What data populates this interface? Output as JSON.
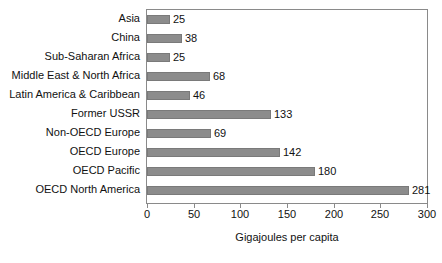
{
  "chart_data": {
    "type": "bar",
    "orientation": "horizontal",
    "title": "",
    "xlabel": "Gigajoules per capita",
    "ylabel": "",
    "xlim": [
      0,
      300
    ],
    "xticks": [
      0,
      50,
      100,
      150,
      200,
      250,
      300
    ],
    "grid": false,
    "legend": false,
    "bar_color": "#8c8c8c",
    "frame_color": "#8a8a8a",
    "show_value_labels": true,
    "categories": [
      "Asia",
      "China",
      "Sub-Saharan Africa",
      "Middle East & North Africa",
      "Latin America & Caribbean",
      "Former USSR",
      "Non-OECD Europe",
      "OECD Europe",
      "OECD Pacific",
      "OECD North America"
    ],
    "values": [
      25,
      38,
      25,
      68,
      46,
      133,
      69,
      142,
      180,
      281
    ],
    "value_labels": [
      "25",
      "38",
      "25",
      "68",
      "46",
      "133",
      "69",
      "142",
      "180",
      "281"
    ]
  }
}
